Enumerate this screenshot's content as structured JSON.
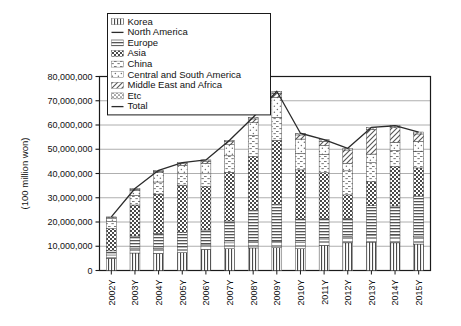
{
  "chart_data": {
    "type": "bar",
    "subtype": "stacked-bar-with-total-line",
    "title": "",
    "subtitle": "",
    "xlabel": "",
    "ylabel": "(100 million won)",
    "ylim": [
      0,
      80000000
    ],
    "ytick_step": 10000000,
    "grid": true,
    "legend_position": "top-left-inside",
    "categories": [
      "2002Y",
      "2003Y",
      "2004Y",
      "2005Y",
      "2006Y",
      "2007Y",
      "2008Y",
      "2009Y",
      "2010Y",
      "2011Y",
      "2012Y",
      "2013Y",
      "2014Y",
      "2015Y"
    ],
    "ytick_labels": [
      "0",
      "10,000,000",
      "20,000,000",
      "30,000,000",
      "40,000,000",
      "50,000,000",
      "60,000,000",
      "70,000,000",
      "80,000,000"
    ],
    "ytick_values": [
      0,
      10000000,
      20000000,
      30000000,
      40000000,
      50000000,
      60000000,
      70000000,
      80000000
    ],
    "series": [
      {
        "name": "Korea",
        "pattern": "vertical-lines",
        "values": [
          5000000,
          7200000,
          7000000,
          7400000,
          8700000,
          9000000,
          9300000,
          9400000,
          9000000,
          10400000,
          11400000,
          11700000,
          11400000,
          10900000
        ]
      },
      {
        "name": "North America",
        "pattern": "solid-line",
        "values": [
          1400000,
          1800000,
          2200000,
          2300000,
          2200000,
          2400000,
          2500000,
          2600000,
          2500000,
          2600000,
          2700000,
          2900000,
          3000000,
          3000000
        ]
      },
      {
        "name": "Europe",
        "pattern": "dense-horizontal-lines",
        "values": [
          1700000,
          5200000,
          6100000,
          5900000,
          5800000,
          9000000,
          13000000,
          15200000,
          9700000,
          8300000,
          7300000,
          12100000,
          12200000,
          16800000
        ]
      },
      {
        "name": "Asia",
        "pattern": "checkerboard",
        "values": [
          9100000,
          12800000,
          16200000,
          19600000,
          17900000,
          20100000,
          22200000,
          26500000,
          20300000,
          19000000,
          9800000,
          9900000,
          16200000,
          11600000
        ]
      },
      {
        "name": "China",
        "pattern": "fine-dots-dashes",
        "values": [
          3000000,
          4000000,
          5000000,
          4700000,
          5300000,
          6800000,
          8600000,
          9500000,
          6800000,
          7600000,
          9900000,
          7900000,
          6700000,
          6900000
        ]
      },
      {
        "name": "Central and South America",
        "pattern": "sparse-dots",
        "values": [
          1400000,
          2000000,
          3800000,
          3500000,
          4300000,
          4600000,
          5400000,
          8200000,
          5900000,
          3700000,
          3100000,
          3500000,
          3400000,
          4100000
        ]
      },
      {
        "name": "Middle East and Africa",
        "pattern": "diagonal-hatch",
        "values": [
          300000,
          500000,
          600000,
          700000,
          900000,
          1200000,
          1500000,
          1700000,
          1700000,
          1700000,
          5500000,
          10200000,
          6000000,
          3000000
        ]
      },
      {
        "name": "Etc",
        "pattern": "dotted-coarse",
        "values": [
          200000,
          300000,
          400000,
          400000,
          500000,
          600000,
          700000,
          800000,
          700000,
          700000,
          700000,
          800000,
          800000,
          800000
        ]
      }
    ],
    "total_line": {
      "name": "Total",
      "pattern": "solid-line",
      "values": [
        22100000,
        33800000,
        41300000,
        44500000,
        45600000,
        53700000,
        63200000,
        73900000,
        56600000,
        54000000,
        50400000,
        59000000,
        59700000,
        57100000
      ]
    }
  },
  "legend": {
    "items": [
      {
        "label": "Korea",
        "swatch": "vertical-lines"
      },
      {
        "label": "North America",
        "swatch": "solid-line"
      },
      {
        "label": "Europe",
        "swatch": "dense-horizontal-lines"
      },
      {
        "label": "Asia",
        "swatch": "checkerboard"
      },
      {
        "label": "China",
        "swatch": "fine-dots-dashes"
      },
      {
        "label": "Central and South America",
        "swatch": "sparse-dots"
      },
      {
        "label": "Middle East and Africa",
        "swatch": "diagonal-hatch"
      },
      {
        "label": "Etc",
        "swatch": "dotted-coarse"
      },
      {
        "label": "Total",
        "swatch": "solid-line"
      }
    ]
  },
  "axes": {
    "y_title": "(100 million won)"
  },
  "colors": {
    "axis": "#1a1a1a",
    "grid": "#9a9a9a",
    "ink": "#3a3a3a",
    "background": "#ffffff"
  }
}
